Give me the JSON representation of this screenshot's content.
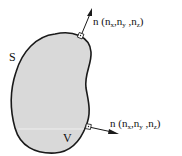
{
  "diagram": {
    "type": "surface-normal-illustration",
    "surface_label": "S",
    "volume_label": "V",
    "normals": [
      {
        "symbol": "n",
        "open": " (",
        "c1": "n",
        "s1": "x",
        "sep1": ",",
        "c2": "n",
        "s2": "y",
        "sep2": " ,",
        "c3": "n",
        "s3": "z",
        "close": ")"
      },
      {
        "symbol": "n",
        "open": " (",
        "c1": "n",
        "s1": "x",
        "sep1": ",",
        "c2": "n",
        "s2": "y",
        "sep2": " ,",
        "c3": "n",
        "s3": "z",
        "close": ")"
      }
    ],
    "colors": {
      "region_fill": "#d9d9d9",
      "outline": "#1a1a1a",
      "background": "#ffffff"
    }
  }
}
